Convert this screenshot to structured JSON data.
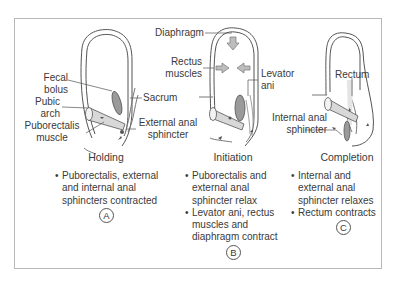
{
  "figure": {
    "panels": [
      {
        "id": "A",
        "phase": "Holding",
        "labels": {
          "fecal_bolus_1": "Fecal",
          "fecal_bolus_2": "bolus",
          "pubic_arch_1": "Pubic",
          "pubic_arch_2": "arch",
          "puborectalis_1": "Puborectalis",
          "puborectalis_2": "muscle",
          "sacrum": "Sacrum",
          "external_anal_sphincter": "External anal sphincter"
        },
        "bullets": [
          [
            "Puborectalis, external",
            "and internal anal",
            "sphincters contracted"
          ]
        ],
        "letter": "A"
      },
      {
        "id": "B",
        "phase": "Initiation",
        "labels": {
          "diaphragm": "Diaphragm",
          "rectus_1": "Rectus",
          "rectus_2": "muscles",
          "levator_1": "Levator",
          "levator_2": "ani"
        },
        "bullets": [
          [
            "Puborectalis and",
            "external anal",
            "sphincter relax"
          ],
          [
            "Levator ani, rectus",
            "muscles and",
            "diaphragm contract"
          ]
        ],
        "letter": "B"
      },
      {
        "id": "C",
        "phase": "Completion",
        "labels": {
          "rectum": "Rectum",
          "internal_1": "Internal anal",
          "internal_2": "sphincter"
        },
        "bullets": [
          [
            "Internal and",
            "external anal",
            "sphincter relaxes"
          ],
          [
            "Rectum contracts"
          ]
        ],
        "letter": "C"
      }
    ],
    "colors": {
      "frame": "#b8b8b8",
      "outline": "#555555",
      "muscle_fill": "#d8d8d8",
      "bolus_fill": "#9a9a9a",
      "arrow_fill": "#bdbdbd",
      "text": "#3a3a3a"
    }
  }
}
